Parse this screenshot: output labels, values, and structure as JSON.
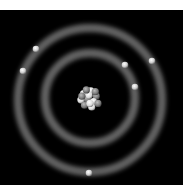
{
  "diagram": {
    "background": "#000000",
    "nucleus": {
      "cx": 89,
      "cy": 98,
      "r": 12,
      "particle_count": 14
    },
    "shells": [
      {
        "name": "inner-shell",
        "cx": 90,
        "cy": 98,
        "r": 45,
        "electrons": 3
      },
      {
        "name": "outer-shell",
        "cx": 90,
        "cy": 100,
        "r": 72,
        "electrons": 3
      }
    ],
    "electrons": [
      {
        "x": 36,
        "y": 49
      },
      {
        "x": 23,
        "y": 71
      },
      {
        "x": 125,
        "y": 65
      },
      {
        "x": 152,
        "y": 61
      },
      {
        "x": 135,
        "y": 87
      },
      {
        "x": 89,
        "y": 173
      }
    ],
    "ring_color": "#9a9a9a",
    "electron_color": "#cfcfcf"
  }
}
